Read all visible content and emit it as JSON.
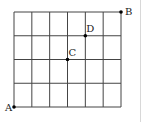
{
  "diagram": {
    "type": "grid",
    "columns": 6,
    "rows": 4,
    "grid_box": {
      "left": 14,
      "top": 12,
      "right": 121,
      "bottom": 107
    },
    "line_color": "#444444",
    "points": [
      {
        "label": "A",
        "col": 0,
        "row": 4,
        "label_dx": -9,
        "label_dy": 4
      },
      {
        "label": "B",
        "col": 6,
        "row": 0,
        "label_dx": 4,
        "label_dy": 3
      },
      {
        "label": "C",
        "col": 3,
        "row": 2,
        "label_dx": 1,
        "label_dy": -4
      },
      {
        "label": "D",
        "col": 4,
        "row": 1,
        "label_dx": 1,
        "label_dy": -4
      }
    ]
  }
}
